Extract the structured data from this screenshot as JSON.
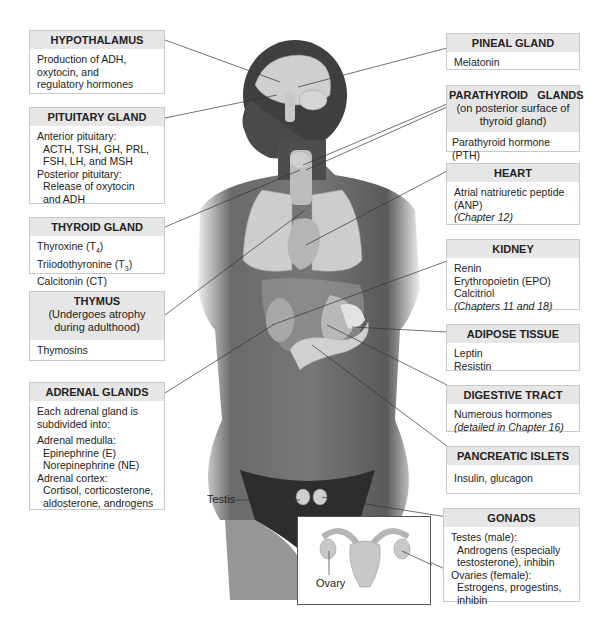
{
  "left_boxes": {
    "hypothalamus": {
      "title": "HYPOTHALAMUS",
      "lines": [
        "Production of ADH,",
        "oxytocin, and",
        "regulatory hormones"
      ]
    },
    "pituitary": {
      "title": "PITUITARY GLAND",
      "lines": [
        "Anterior pituitary:",
        "ACTH, TSH, GH, PRL,",
        "FSH, LH, and MSH",
        "Posterior pituitary:",
        "Release of oxytocin",
        "and ADH"
      ]
    },
    "thyroid": {
      "title": "THYROID GLAND",
      "lines": [
        "Thyroxine (T",
        "4",
        ")",
        "Triiodothyronine (T",
        "3",
        ")",
        "Calcitonin (CT)"
      ]
    },
    "thymus": {
      "title": "THYMUS",
      "subtitle_1": "(Undergoes atrophy",
      "subtitle_2": "during adulthood)",
      "lines": [
        "Thymosins"
      ]
    },
    "adrenal": {
      "title": "ADRENAL GLANDS",
      "lines": [
        "Each adrenal gland is",
        "subdivided into:",
        "Adrenal medulla:",
        "Epinephrine (E)",
        "Norepinephrine (NE)",
        "Adrenal cortex:",
        "Cortisol, corticosterone,",
        "aldosterone, androgens"
      ]
    }
  },
  "right_boxes": {
    "pineal": {
      "title": "PINEAL GLAND",
      "lines": [
        "Melatonin"
      ]
    },
    "parathyroid": {
      "title": "PARATHYROID   GLANDS",
      "subtitle_1": "(on posterior surface of",
      "subtitle_2": "thyroid gland)",
      "lines": [
        "Parathyroid hormone (PTH)"
      ]
    },
    "heart": {
      "title": "HEART",
      "lines": [
        "Atrial natriuretic peptide",
        "(ANP)",
        "(Chapter 12)"
      ]
    },
    "kidney": {
      "title": "KIDNEY",
      "lines": [
        "Renin",
        "Erythropoietin (EPO)",
        "Calcitriol",
        "(Chapters 11 and 18)"
      ]
    },
    "adipose": {
      "title": "ADIPOSE TISSUE",
      "lines": [
        "Leptin",
        "Resistin"
      ]
    },
    "digestive": {
      "title": "DIGESTIVE TRACT",
      "lines": [
        "Numerous hormones",
        "(detailed in Chapter 16)"
      ]
    },
    "pancreatic": {
      "title": "PANCREATIC ISLETS",
      "lines": [
        "Insulin, glucagon"
      ]
    },
    "gonads": {
      "title": "GONADS",
      "lines": [
        "Testes (male):",
        "Androgens (especially",
        "testosterone), inhibin",
        "Ovaries (female):",
        "Estrogens, progestins,",
        "inhibin"
      ]
    }
  },
  "figure_labels": {
    "testis": "Testis",
    "ovary": "Ovary"
  },
  "colors": {
    "header_bg": "#e6e6e6",
    "border": "#c8c8c8",
    "skin_dark": "#4a4a4a",
    "organ_light": "#d8d8d8"
  }
}
